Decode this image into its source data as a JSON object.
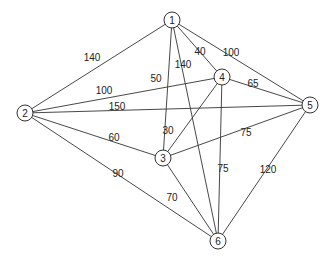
{
  "graph": {
    "nodes": [
      {
        "id": "1",
        "x": 172,
        "y": 20
      },
      {
        "id": "2",
        "x": 25,
        "y": 113
      },
      {
        "id": "3",
        "x": 163,
        "y": 158
      },
      {
        "id": "4",
        "x": 222,
        "y": 77
      },
      {
        "id": "5",
        "x": 310,
        "y": 105
      },
      {
        "id": "6",
        "x": 218,
        "y": 241
      }
    ],
    "edges": [
      {
        "from": "1",
        "to": "2",
        "weight": "140",
        "lx": 92,
        "ly": 61
      },
      {
        "from": "1",
        "to": "3",
        "weight": "50",
        "lx": 156,
        "ly": 82
      },
      {
        "from": "1",
        "to": "6",
        "weight": "140",
        "lx": 183,
        "ly": 68
      },
      {
        "from": "1",
        "to": "4",
        "weight": "40",
        "lx": 200,
        "ly": 55
      },
      {
        "from": "1",
        "to": "5",
        "weight": "100",
        "lx": 231,
        "ly": 56
      },
      {
        "from": "2",
        "to": "4",
        "weight": "100",
        "lx": 104,
        "ly": 94
      },
      {
        "from": "2",
        "to": "5",
        "weight": "150",
        "lx": 117,
        "ly": 110
      },
      {
        "from": "2",
        "to": "3",
        "weight": "60",
        "lx": 114,
        "ly": 141
      },
      {
        "from": "2",
        "to": "6",
        "weight": "90",
        "lx": 118,
        "ly": 177
      },
      {
        "from": "4",
        "to": "5",
        "weight": "65",
        "lx": 253,
        "ly": 87
      },
      {
        "from": "3",
        "to": "4",
        "weight": "30",
        "lx": 168,
        "ly": 134
      },
      {
        "from": "3",
        "to": "5",
        "weight": "75",
        "lx": 246,
        "ly": 136
      },
      {
        "from": "4",
        "to": "6",
        "weight": "75",
        "lx": 223,
        "ly": 172
      },
      {
        "from": "3",
        "to": "6",
        "weight": "70",
        "lx": 172,
        "ly": 201
      },
      {
        "from": "5",
        "to": "6",
        "weight": "120",
        "lx": 268,
        "ly": 173
      }
    ]
  }
}
